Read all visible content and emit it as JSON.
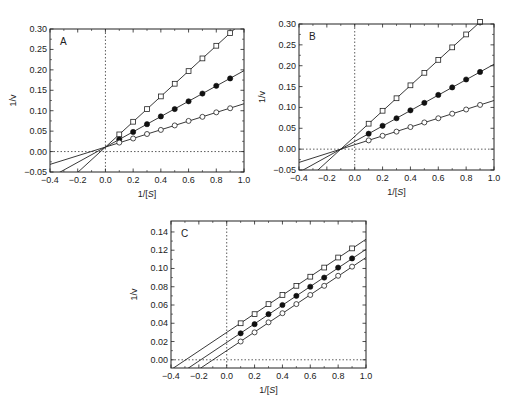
{
  "chart_data": [
    {
      "id": "A",
      "type": "line",
      "title": "",
      "panel_label": "A",
      "xlabel": "1/[S]",
      "ylabel": "1/v",
      "xlim": [
        -0.4,
        1.0
      ],
      "ylim": [
        -0.05,
        0.3
      ],
      "xticks": [
        -0.4,
        -0.2,
        0.0,
        0.2,
        0.4,
        0.6,
        0.8,
        1.0
      ],
      "xtick_labels": [
        "−0.4",
        "−0.2",
        "0.0",
        "0.2",
        "0.4",
        "0.6",
        "0.8",
        "1.0"
      ],
      "yticks": [
        -0.05,
        0.0,
        0.05,
        0.1,
        0.15,
        0.2,
        0.25,
        0.3
      ],
      "ytick_labels": [
        "−0.05",
        "0.00",
        "0.05",
        "0.10",
        "0.15",
        "0.20",
        "0.25",
        "0.30"
      ],
      "grid": false,
      "reference_lines": {
        "x_zero_dotted": true,
        "y_zero_dotted": true
      },
      "frame_px": {
        "left": 50,
        "top": 29,
        "right": 244,
        "bottom": 172
      },
      "x": [
        0.1,
        0.2,
        0.3,
        0.4,
        0.5,
        0.6,
        0.7,
        0.8,
        0.9
      ],
      "series": [
        {
          "name": "open squares",
          "marker": "square-open",
          "line": {
            "slope": 0.31,
            "intercept": 0.011
          },
          "values": [
            0.042,
            0.073,
            0.104,
            0.135,
            0.166,
            0.197,
            0.228,
            0.259,
            0.29
          ]
        },
        {
          "name": "filled circles",
          "marker": "circle-filled",
          "line": {
            "slope": 0.187,
            "intercept": 0.011
          },
          "values": [
            0.03,
            0.048,
            0.067,
            0.086,
            0.104,
            0.123,
            0.142,
            0.161,
            0.179
          ]
        },
        {
          "name": "open circles",
          "marker": "circle-open",
          "line": {
            "slope": 0.106,
            "intercept": 0.011
          },
          "values": [
            0.022,
            0.032,
            0.043,
            0.053,
            0.064,
            0.075,
            0.085,
            0.096,
            0.106
          ]
        }
      ]
    },
    {
      "id": "B",
      "type": "line",
      "title": "",
      "panel_label": "B",
      "xlabel": "1/[S]",
      "ylabel": "1/v",
      "xlim": [
        -0.4,
        1.0
      ],
      "ylim": [
        -0.05,
        0.3
      ],
      "xticks": [
        -0.4,
        -0.2,
        0.0,
        0.2,
        0.4,
        0.6,
        0.8,
        1.0
      ],
      "xtick_labels": [
        "−0.4",
        "−0.2",
        "0.0",
        "0.2",
        "0.4",
        "0.6",
        "0.8",
        "1.0"
      ],
      "yticks": [
        -0.05,
        0.0,
        0.05,
        0.1,
        0.15,
        0.2,
        0.25,
        0.3
      ],
      "ytick_labels": [
        "−0.05",
        "0.00",
        "0.05",
        "0.10",
        "0.15",
        "0.20",
        "0.25",
        "0.30"
      ],
      "grid": false,
      "reference_lines": {
        "x_zero_dotted": true,
        "y_zero_dotted": true
      },
      "frame_px": {
        "left": 299,
        "top": 24,
        "right": 494,
        "bottom": 170
      },
      "x": [
        0.1,
        0.2,
        0.3,
        0.4,
        0.5,
        0.6,
        0.7,
        0.8,
        0.9
      ],
      "series": [
        {
          "name": "open squares",
          "marker": "square-open",
          "line": {
            "slope": 0.305,
            "intercept": 0.0305
          },
          "values": [
            0.061,
            0.092,
            0.122,
            0.153,
            0.183,
            0.214,
            0.244,
            0.275,
            0.305
          ]
        },
        {
          "name": "filled circles",
          "marker": "circle-filled",
          "line": {
            "slope": 0.185,
            "intercept": 0.0185
          },
          "values": [
            0.037,
            0.056,
            0.074,
            0.093,
            0.111,
            0.13,
            0.148,
            0.167,
            0.185
          ]
        },
        {
          "name": "open circles",
          "marker": "circle-open",
          "line": {
            "slope": 0.106,
            "intercept": 0.0106
          },
          "values": [
            0.021,
            0.032,
            0.042,
            0.053,
            0.064,
            0.074,
            0.085,
            0.095,
            0.106
          ]
        }
      ]
    },
    {
      "id": "C",
      "type": "line",
      "title": "",
      "panel_label": "C",
      "xlabel": "1/[S]",
      "ylabel": "1/v",
      "xlim": [
        -0.4,
        1.0
      ],
      "ylim": [
        -0.009,
        0.152
      ],
      "xticks": [
        -0.4,
        -0.2,
        0.0,
        0.2,
        0.4,
        0.6,
        0.8,
        1.0
      ],
      "xtick_labels": [
        "−0.4",
        "−0.2",
        "0.0",
        "0.2",
        "0.4",
        "0.6",
        "0.8",
        "1.0"
      ],
      "yticks": [
        0.0,
        0.02,
        0.04,
        0.06,
        0.08,
        0.1,
        0.12,
        0.14
      ],
      "ytick_labels": [
        "0.00",
        "0.02",
        "0.04",
        "0.06",
        "0.08",
        "0.10",
        "0.12",
        "0.14"
      ],
      "grid": false,
      "reference_lines": {
        "x_zero_dotted": true,
        "y_zero_dotted": true
      },
      "frame_px": {
        "left": 171,
        "top": 221,
        "right": 366,
        "bottom": 368
      },
      "x": [
        0.1,
        0.2,
        0.3,
        0.4,
        0.5,
        0.6,
        0.7,
        0.8,
        0.9
      ],
      "series": [
        {
          "name": "open squares",
          "marker": "square-open",
          "line": {
            "slope": 0.102,
            "intercept": 0.03
          },
          "values": [
            0.04,
            0.05,
            0.061,
            0.071,
            0.081,
            0.091,
            0.101,
            0.112,
            0.122
          ]
        },
        {
          "name": "filled circles",
          "marker": "circle-filled",
          "line": {
            "slope": 0.102,
            "intercept": 0.019
          },
          "values": [
            0.029,
            0.039,
            0.05,
            0.06,
            0.07,
            0.08,
            0.09,
            0.101,
            0.111
          ]
        },
        {
          "name": "open circles",
          "marker": "circle-open",
          "line": {
            "slope": 0.102,
            "intercept": 0.01
          },
          "values": [
            0.02,
            0.03,
            0.041,
            0.051,
            0.061,
            0.071,
            0.081,
            0.092,
            0.102
          ]
        }
      ]
    }
  ]
}
